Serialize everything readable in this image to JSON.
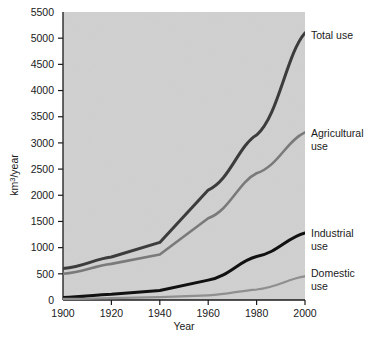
{
  "chart_data": {
    "type": "line",
    "title": "",
    "xlabel": "Year",
    "ylabel": "km3/year",
    "ylabel_parts": {
      "pre": "km",
      "sup": "3",
      "post": "/year"
    },
    "x": [
      1900,
      1920,
      1940,
      1960,
      1980,
      2000
    ],
    "xlim": [
      1900,
      2000
    ],
    "ylim": [
      0,
      5500
    ],
    "xticks": [
      "1900",
      "1920",
      "1940",
      "1960",
      "1980",
      "2000"
    ],
    "yticks": [
      "0",
      "500",
      "1000",
      "1500",
      "2000",
      "2500",
      "3000",
      "3500",
      "4000",
      "4500",
      "5000",
      "5500"
    ],
    "ytick_step": 500,
    "grid": false,
    "legend_position": "inline-right",
    "plot_background": "#d9d9d9",
    "series": [
      {
        "name": "Total use",
        "label_lines": [
          "Total use"
        ],
        "color": "#3c3c3c",
        "width": 3.0,
        "values": [
          600,
          820,
          1100,
          2100,
          3150,
          5100
        ],
        "label_y": 5060
      },
      {
        "name": "Agricultural use",
        "label_lines": [
          "Agricultural",
          "use"
        ],
        "color": "#7a7a7a",
        "width": 2.6,
        "values": [
          500,
          690,
          870,
          1560,
          2420,
          3200
        ],
        "label_y": 3180
      },
      {
        "name": "Industrial use",
        "label_lines": [
          "Industrial",
          "use"
        ],
        "color": "#111111",
        "width": 3.0,
        "values": [
          50,
          110,
          180,
          380,
          830,
          1280
        ],
        "label_y": 1270
      },
      {
        "name": "Domestic use",
        "label_lines": [
          "Domestic",
          "use"
        ],
        "color": "#8f8f8f",
        "width": 2.2,
        "values": [
          20,
          35,
          55,
          90,
          200,
          450
        ],
        "label_y": 520
      }
    ]
  }
}
